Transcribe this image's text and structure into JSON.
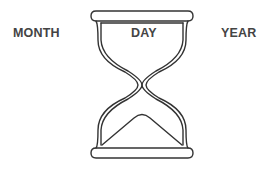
{
  "labels": {
    "left": "MONTH",
    "center": "DAY",
    "right": "YEAR"
  },
  "icon": {
    "name": "hourglass-icon",
    "stroke_color": "#333333",
    "text_color": "#444444"
  }
}
